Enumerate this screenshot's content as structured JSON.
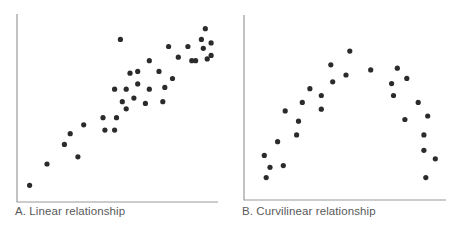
{
  "colors": {
    "point": "#2b2b2b",
    "axis": "#9a9a9a",
    "caption": "#5a5a5a",
    "background": "#ffffff"
  },
  "chart_data": [
    {
      "type": "scatter",
      "title": "A. Linear relationship",
      "xlabel": "",
      "ylabel": "",
      "grid": false,
      "legend": null,
      "axis_ticks": "none",
      "note": "Coordinates are normalized 0-100 within the plot area (x from left axis, y from bottom axis); no numeric tick labels are shown.",
      "points": [
        {
          "x": 5,
          "y": 6
        },
        {
          "x": 14,
          "y": 18
        },
        {
          "x": 23,
          "y": 29
        },
        {
          "x": 26,
          "y": 35
        },
        {
          "x": 30,
          "y": 22
        },
        {
          "x": 33,
          "y": 40
        },
        {
          "x": 43,
          "y": 44
        },
        {
          "x": 44,
          "y": 37
        },
        {
          "x": 49,
          "y": 37
        },
        {
          "x": 50,
          "y": 44
        },
        {
          "x": 53,
          "y": 53
        },
        {
          "x": 55,
          "y": 49
        },
        {
          "x": 55,
          "y": 60
        },
        {
          "x": 49,
          "y": 60
        },
        {
          "x": 52,
          "y": 88
        },
        {
          "x": 57,
          "y": 69
        },
        {
          "x": 59,
          "y": 55
        },
        {
          "x": 61,
          "y": 63
        },
        {
          "x": 61,
          "y": 70
        },
        {
          "x": 65,
          "y": 52
        },
        {
          "x": 67,
          "y": 60
        },
        {
          "x": 67,
          "y": 76
        },
        {
          "x": 72,
          "y": 70
        },
        {
          "x": 74,
          "y": 53
        },
        {
          "x": 75,
          "y": 61
        },
        {
          "x": 77,
          "y": 84
        },
        {
          "x": 79,
          "y": 66
        },
        {
          "x": 82,
          "y": 78
        },
        {
          "x": 87,
          "y": 84
        },
        {
          "x": 89,
          "y": 76
        },
        {
          "x": 94,
          "y": 88
        },
        {
          "x": 96,
          "y": 94
        },
        {
          "x": 97,
          "y": 77
        },
        {
          "x": 91,
          "y": 76
        },
        {
          "x": 95,
          "y": 83
        },
        {
          "x": 99,
          "y": 86
        },
        {
          "x": 99,
          "y": 79
        }
      ]
    },
    {
      "type": "scatter",
      "title": "B. Curvilinear relationship",
      "xlabel": "",
      "ylabel": "",
      "grid": false,
      "legend": null,
      "axis_ticks": "none",
      "note": "Coordinates are normalized 0-100 within the plot area (x from left axis, y from bottom axis); no numeric tick labels are shown.",
      "points": [
        {
          "x": 7,
          "y": 22
        },
        {
          "x": 10,
          "y": 15
        },
        {
          "x": 8,
          "y": 9
        },
        {
          "x": 14,
          "y": 30
        },
        {
          "x": 17,
          "y": 16
        },
        {
          "x": 18,
          "y": 48
        },
        {
          "x": 24,
          "y": 34
        },
        {
          "x": 25,
          "y": 42
        },
        {
          "x": 27,
          "y": 53
        },
        {
          "x": 31,
          "y": 61
        },
        {
          "x": 37,
          "y": 57
        },
        {
          "x": 37,
          "y": 49
        },
        {
          "x": 42,
          "y": 75
        },
        {
          "x": 43,
          "y": 65
        },
        {
          "x": 50,
          "y": 69
        },
        {
          "x": 52,
          "y": 83
        },
        {
          "x": 63,
          "y": 72
        },
        {
          "x": 74,
          "y": 64
        },
        {
          "x": 75,
          "y": 57
        },
        {
          "x": 77,
          "y": 73
        },
        {
          "x": 82,
          "y": 67
        },
        {
          "x": 81,
          "y": 43
        },
        {
          "x": 88,
          "y": 53
        },
        {
          "x": 93,
          "y": 45
        },
        {
          "x": 91,
          "y": 34
        },
        {
          "x": 91,
          "y": 25
        },
        {
          "x": 97,
          "y": 20
        },
        {
          "x": 92,
          "y": 9
        }
      ]
    }
  ],
  "panels": [
    {
      "caption": "A. Linear relationship"
    },
    {
      "caption": "B. Curvilinear relationship"
    }
  ]
}
